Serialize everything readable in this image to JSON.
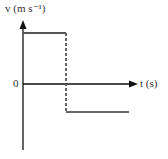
{
  "diagram": {
    "type": "velocity-time graph",
    "y_axis_label": "v (m s⁻¹)",
    "x_axis_label": "t (s)",
    "origin_label": "0",
    "segments": [
      {
        "name": "positive constant velocity",
        "style": "solid"
      },
      {
        "name": "instantaneous reversal",
        "style": "dashed"
      },
      {
        "name": "negative constant velocity",
        "style": "solid"
      }
    ],
    "colors": {
      "axes": "#111111",
      "graph_line": "#555555"
    }
  }
}
